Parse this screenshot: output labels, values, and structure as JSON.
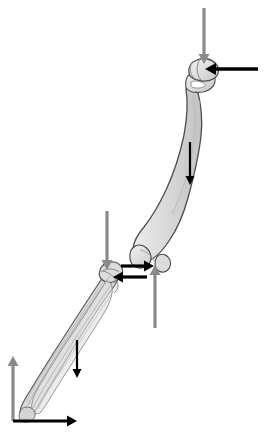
{
  "figure": {
    "background_color": "#ffffff",
    "canvas": {
      "width": 265,
      "height": 435
    }
  },
  "palette": {
    "bone_fill": "#d9d9d9",
    "bone_fill_light": "#e6e6e6",
    "bone_fill_shadow": "#c4c4c4",
    "bone_outline": "#4d4d4d",
    "bone_detail_line": "#8c8c8c",
    "gray_arrow": "#8a8a8a",
    "black_arrow": "#000000",
    "background": "#ffffff"
  },
  "bones": [
    {
      "name": "femur",
      "label": "Femur",
      "region": "upper-right",
      "landmarks": [
        "femoral-head",
        "greater-trochanter",
        "femoral-shaft",
        "medial-condyle",
        "lateral-condyle"
      ]
    },
    {
      "name": "tibia-fibula",
      "label": "Tibia and Fibula",
      "region": "lower-left",
      "landmarks": [
        "tibial-plateau",
        "tibial-shaft",
        "fibula",
        "medial-malleolus"
      ]
    }
  ],
  "arrows": [
    {
      "id": "hip-joint-reaction-vertical",
      "label": "Hip vertical load",
      "color_key": "gray_arrow",
      "color": "#8a8a8a",
      "direction": "down",
      "orientation": "vertical",
      "x1": 204,
      "y1": 8,
      "x2": 204,
      "y2": 64,
      "width": 3.2,
      "head_width": 11,
      "head_length": 10,
      "attaches_to": "femoral-head"
    },
    {
      "id": "hip-joint-reaction-horizontal",
      "label": "Hip horizontal load",
      "color_key": "black_arrow",
      "color": "#000000",
      "direction": "left",
      "orientation": "horizontal",
      "x1": 258,
      "y1": 69,
      "x2": 205,
      "y2": 69,
      "width": 3.4,
      "head_width": 12,
      "head_length": 11,
      "attaches_to": "femoral-head"
    },
    {
      "id": "femur-weight",
      "label": "Femur segment weight",
      "color_key": "black_arrow",
      "color": "#000000",
      "direction": "down",
      "orientation": "vertical",
      "x1": 190,
      "y1": 142,
      "x2": 190,
      "y2": 185,
      "width": 2.2,
      "head_width": 9,
      "head_length": 9,
      "attaches_to": "femoral-shaft"
    },
    {
      "id": "knee-force-on-femur-upward",
      "label": "Knee joint vertical force on femur",
      "color_key": "gray_arrow",
      "color": "#8a8a8a",
      "direction": "up",
      "orientation": "vertical",
      "x1": 155,
      "y1": 328,
      "x2": 155,
      "y2": 265,
      "width": 3.2,
      "head_width": 11,
      "head_length": 10,
      "attaches_to": "femoral-condyles"
    },
    {
      "id": "knee-shear-on-femur-rightward",
      "label": "Knee shear force on femur",
      "color_key": "black_arrow",
      "color": "#000000",
      "direction": "right",
      "orientation": "horizontal",
      "x1": 121,
      "y1": 266,
      "x2": 154,
      "y2": 266,
      "width": 3.2,
      "head_width": 11,
      "head_length": 10,
      "attaches_to": "femoral-condyles"
    },
    {
      "id": "knee-shear-on-tibia-leftward",
      "label": "Knee shear force on tibia",
      "color_key": "black_arrow",
      "color": "#000000",
      "direction": "left",
      "orientation": "horizontal",
      "x1": 147,
      "y1": 277,
      "x2": 113,
      "y2": 277,
      "width": 3.2,
      "head_width": 11,
      "head_length": 10,
      "attaches_to": "tibial-plateau"
    },
    {
      "id": "knee-force-on-tibia-downward",
      "label": "Knee joint vertical force on tibia",
      "color_key": "gray_arrow",
      "color": "#8a8a8a",
      "direction": "down",
      "orientation": "vertical",
      "x1": 107,
      "y1": 211,
      "x2": 107,
      "y2": 270,
      "width": 3.2,
      "head_width": 11,
      "head_length": 10,
      "attaches_to": "tibial-plateau"
    },
    {
      "id": "tibia-weight",
      "label": "Shank segment weight",
      "color_key": "black_arrow",
      "color": "#000000",
      "direction": "down",
      "orientation": "vertical",
      "x1": 77,
      "y1": 340,
      "x2": 77,
      "y2": 378,
      "width": 2.2,
      "head_width": 9,
      "head_length": 9,
      "attaches_to": "tibial-shaft"
    },
    {
      "id": "ground-reaction-vertical",
      "label": "Ground reaction vertical component",
      "color_key": "gray_arrow",
      "color": "#8a8a8a",
      "direction": "up",
      "orientation": "vertical",
      "x1": 13,
      "y1": 421,
      "x2": 13,
      "y2": 356,
      "width": 3.2,
      "head_width": 11,
      "head_length": 10,
      "attaches_to": "ankle"
    },
    {
      "id": "ground-reaction-horizontal",
      "label": "Ground reaction horizontal component",
      "color_key": "black_arrow",
      "color": "#000000",
      "direction": "right",
      "orientation": "horizontal",
      "x1": 13,
      "y1": 421,
      "x2": 77,
      "y2": 421,
      "width": 3.2,
      "head_width": 11,
      "head_length": 10,
      "attaches_to": "ankle"
    }
  ],
  "annotations": {
    "gray_arrow_count": 4,
    "black_arrow_count": 6,
    "total_arrow_count": 10
  }
}
